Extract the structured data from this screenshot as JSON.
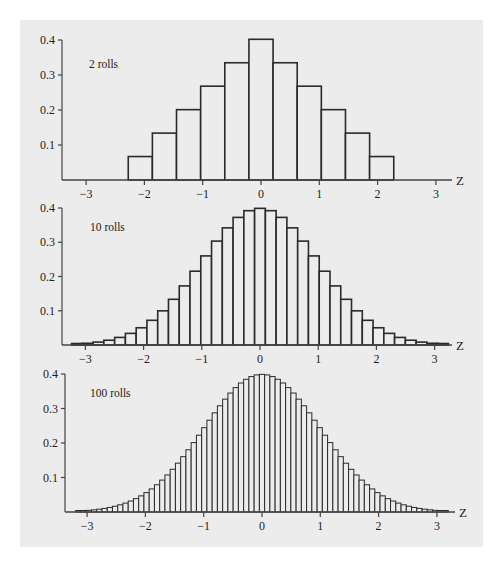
{
  "colors": {
    "background": "#ffffff",
    "panel": "#ececec",
    "bar_fill": "#ececec",
    "stroke": "#2a2a2a"
  },
  "chart_data": [
    {
      "type": "bar",
      "title": "2 rolls",
      "xlabel": "Z",
      "ylabel": "",
      "xlim": [
        -3.3,
        3.3
      ],
      "ylim": [
        0,
        0.4
      ],
      "x_ticks": [
        -3,
        -2,
        -1,
        0,
        1,
        2,
        3
      ],
      "x_tick_labels": [
        "−3",
        "−2",
        "−1",
        "0",
        "1",
        "2",
        "3"
      ],
      "y_ticks": [
        0.1,
        0.2,
        0.3,
        0.4
      ],
      "y_tick_labels": [
        "0.1",
        "0.2",
        "0.3",
        "0.4"
      ],
      "grid": false,
      "bar_width": 0.414,
      "x": [
        -2.07,
        -1.656,
        -1.242,
        -0.828,
        -0.414,
        0,
        0.414,
        0.828,
        1.242,
        1.656,
        2.07
      ],
      "values": [
        0.067,
        0.134,
        0.201,
        0.268,
        0.335,
        0.402,
        0.335,
        0.268,
        0.201,
        0.134,
        0.067
      ]
    },
    {
      "type": "bar",
      "title": "10 rolls",
      "xlabel": "Z",
      "ylabel": "",
      "xlim": [
        -3.3,
        3.3
      ],
      "ylim": [
        0,
        0.4
      ],
      "x_ticks": [
        -3,
        -2,
        -1,
        0,
        1,
        2,
        3
      ],
      "x_tick_labels": [
        "−3",
        "−2",
        "−1",
        "0",
        "1",
        "2",
        "3"
      ],
      "y_ticks": [
        0.1,
        0.2,
        0.3,
        0.4
      ],
      "y_tick_labels": [
        "0.1",
        "0.2",
        "0.3",
        "0.4"
      ],
      "grid": false,
      "bar_width": 0.185,
      "x_range": [
        -3.145,
        3.145
      ],
      "distribution": "normal-approx, 35 bars"
    },
    {
      "type": "bar",
      "title": "100 rolls",
      "xlabel": "Z",
      "ylabel": "",
      "xlim": [
        -3.3,
        3.3
      ],
      "ylim": [
        0,
        0.4
      ],
      "x_ticks": [
        -3,
        -2,
        -1,
        0,
        1,
        2,
        3
      ],
      "x_tick_labels": [
        "−3",
        "−2",
        "−1",
        "0",
        "1",
        "2",
        "3"
      ],
      "y_ticks": [
        0.1,
        0.2,
        0.3,
        0.4
      ],
      "y_tick_labels": [
        "0.1",
        "0.2",
        "0.3",
        "0.4"
      ],
      "grid": false,
      "bar_width": 0.09,
      "x_range": [
        -3.15,
        3.15
      ],
      "distribution": "normal-approx, 71 bars"
    }
  ],
  "panels": [
    {
      "label": "2 rolls",
      "axis_label": "Z"
    },
    {
      "label": "10 rolls",
      "axis_label": "Z"
    },
    {
      "label": "100 rolls",
      "axis_label": "Z"
    }
  ]
}
